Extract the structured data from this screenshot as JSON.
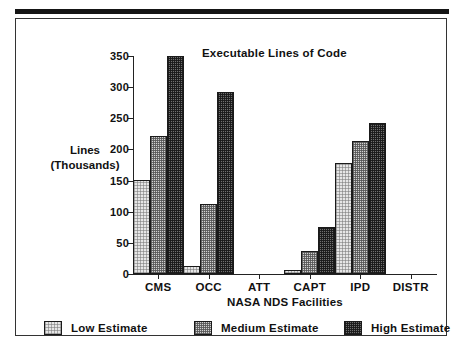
{
  "chart_data": {
    "type": "bar",
    "title": "Executable Lines of Code",
    "xlabel": "NASA NDS Facilities",
    "ylabel_line1": "Lines",
    "ylabel_line2": "(Thousands)",
    "categories": [
      "CMS",
      "OCC",
      "ATT",
      "CAPT",
      "IPD",
      "DISTR"
    ],
    "ylim": [
      0,
      350
    ],
    "yticks": [
      0,
      50,
      100,
      150,
      200,
      250,
      300,
      350
    ],
    "ytick_labels": [
      "0",
      "50",
      "100",
      "150",
      "200",
      "250",
      "300",
      "350"
    ],
    "grid": false,
    "legend_position": "bottom",
    "series": [
      {
        "name": "Low Estimate",
        "fill": "light-dither",
        "color": "#e6e6e6",
        "values": [
          151,
          13,
          0,
          7,
          179,
          0
        ]
      },
      {
        "name": "Medium Estimate",
        "fill": "medium-dither",
        "color": "#d2d2d2",
        "values": [
          221,
          112,
          0,
          37,
          214,
          0
        ]
      },
      {
        "name": "High Estimate",
        "fill": "dark-dither",
        "color": "#6f6f6f",
        "values": [
          350,
          293,
          0,
          75,
          242,
          0
        ]
      }
    ]
  }
}
